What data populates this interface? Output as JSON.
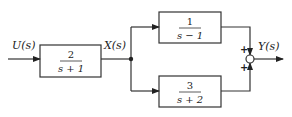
{
  "diagram": {
    "input_label": "U(s)",
    "intermediate_label": "X(s)",
    "output_label": "Y(s)",
    "blocks": [
      {
        "id": "G1",
        "numerator": "2",
        "denominator": "s + 1"
      },
      {
        "id": "G2",
        "numerator": "1",
        "denominator": "s − 1"
      },
      {
        "id": "G3",
        "numerator": "3",
        "denominator": "s + 2"
      }
    ],
    "summing_junction": {
      "top_sign": "+",
      "bottom_sign": "+"
    }
  }
}
